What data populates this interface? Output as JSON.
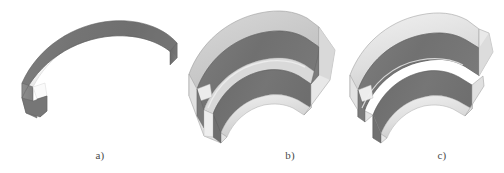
{
  "figure": {
    "background_color": "#ffffff",
    "width": 504,
    "height": 173,
    "panels": [
      {
        "id": "a",
        "caption": "a)",
        "description": "solid curved arc-segment block, white top face, gray outer side face"
      },
      {
        "id": "b",
        "caption": "b)",
        "description": "curved U-channel segment, gray inner walls and floor, light gray rim edges"
      },
      {
        "id": "c",
        "caption": "c)",
        "description": "curved segment with two separated gray flange strips, base removed"
      }
    ]
  },
  "captions": {
    "a": "a)",
    "b": "b)",
    "c": "c)"
  },
  "colors": {
    "background": "#ffffff",
    "top_face": "#fbfbfb",
    "face_dark": "#757575",
    "face_dark_2": "#6d6d6d",
    "face_mid": "#8a8a8a",
    "rim_light": "#e4e4e4",
    "rim_light_2": "#d2d2d2",
    "edge_line": "#b9b9b9",
    "caption_text": "#4a4a4a"
  }
}
